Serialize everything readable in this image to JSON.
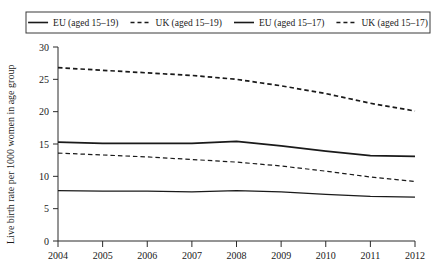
{
  "chart_data": {
    "type": "line",
    "title": "",
    "subtitle": "",
    "xlabel": "",
    "ylabel": "Live birth rate per 1000 women in age group",
    "x": [
      2004,
      2005,
      2006,
      2007,
      2008,
      2009,
      2010,
      2011,
      2012
    ],
    "categories": [
      "2004",
      "2005",
      "2006",
      "2007",
      "2008",
      "2009",
      "2010",
      "2011",
      "2012"
    ],
    "xlim": [
      2004,
      2012
    ],
    "ylim": [
      0,
      30
    ],
    "yticks": [
      0,
      5,
      10,
      15,
      20,
      25,
      30
    ],
    "ytick_labels": [
      "0",
      "5",
      "10",
      "15",
      "20",
      "25",
      "30"
    ],
    "xticks": [
      2004,
      2005,
      2006,
      2007,
      2008,
      2009,
      2010,
      2011,
      2012
    ],
    "xtick_labels": [
      "2004",
      "2005",
      "2006",
      "2007",
      "2008",
      "2009",
      "2010",
      "2011",
      "2012"
    ],
    "grid": false,
    "legend_position": "top",
    "series": [
      {
        "name": "EU (aged 15–19)",
        "style": "solid",
        "color": "#1a1a1a",
        "width": 1.8,
        "values": [
          15.3,
          15.1,
          15.1,
          15.1,
          15.4,
          14.7,
          13.9,
          13.2,
          13.1
        ]
      },
      {
        "name": "UK (aged 15–19)",
        "style": "dashed",
        "color": "#1a1a1a",
        "width": 1.7,
        "values": [
          26.8,
          26.4,
          26.0,
          25.6,
          25.0,
          24.0,
          22.8,
          21.3,
          20.1
        ]
      },
      {
        "name": "EU (aged 15–17)",
        "style": "solid",
        "color": "#1a1a1a",
        "width": 1.2,
        "values": [
          7.8,
          7.7,
          7.7,
          7.6,
          7.8,
          7.6,
          7.2,
          6.9,
          6.8
        ]
      },
      {
        "name": "UK (aged 15–17)",
        "style": "dashed",
        "color": "#1a1a1a",
        "width": 1.2,
        "values": [
          13.6,
          13.3,
          13.0,
          12.6,
          12.2,
          11.6,
          10.8,
          9.9,
          9.2
        ]
      }
    ]
  },
  "legend": {
    "items": [
      {
        "label": "EU (aged 15–19)",
        "style": "solid"
      },
      {
        "label": "UK (aged 15–19)",
        "style": "dashed"
      },
      {
        "label": "EU (aged 15–17)",
        "style": "solid"
      },
      {
        "label": "UK (aged 15–17)",
        "style": "dashed"
      }
    ]
  },
  "axes": {
    "y_title": "Live birth rate per 1000 women in age group"
  }
}
